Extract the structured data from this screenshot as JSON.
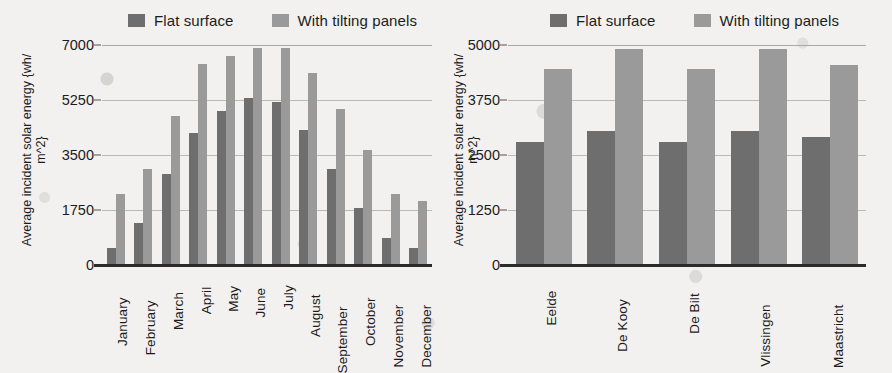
{
  "chart_data": [
    {
      "type": "bar",
      "id": "monthly",
      "title": "",
      "xlabel": "",
      "ylabel": "Average incident solar energy {wh/\nm^2}",
      "ylim": [
        0,
        7000
      ],
      "yticks": [
        0,
        1750,
        3500,
        5250,
        7000
      ],
      "ytick_labels": [
        "0",
        "1750",
        "3500",
        "5250",
        "7000"
      ],
      "grid": true,
      "legend_position": "top",
      "categories": [
        "January",
        "February",
        "March",
        "April",
        "May",
        "June",
        "July",
        "August",
        "September",
        "October",
        "November",
        "December"
      ],
      "series": [
        {
          "name": "Flat surface",
          "color": "#6e6e6e",
          "values": [
            550,
            1350,
            2900,
            4200,
            4900,
            5300,
            5200,
            4300,
            3050,
            1800,
            850,
            550
          ]
        },
        {
          "name": "With tilting panels",
          "color": "#9a9a9a",
          "values": [
            2250,
            3050,
            4750,
            6400,
            6650,
            6900,
            6900,
            6100,
            4950,
            3650,
            2250,
            2050
          ]
        }
      ]
    },
    {
      "type": "bar",
      "id": "stations",
      "title": "",
      "xlabel": "",
      "ylabel": "Average incident solar energy {wh/\nm^2}",
      "ylim": [
        0,
        5000
      ],
      "yticks": [
        0,
        1250,
        2500,
        3750,
        5000
      ],
      "ytick_labels": [
        "0",
        "1250",
        "2500",
        "3750",
        "5000"
      ],
      "grid": true,
      "legend_position": "top",
      "categories": [
        "Eelde",
        "De Kooy",
        "De Bilt",
        "Vlissingen",
        "Maastricht"
      ],
      "series": [
        {
          "name": "Flat surface",
          "color": "#6e6e6e",
          "values": [
            2800,
            3050,
            2800,
            3050,
            2900
          ]
        },
        {
          "name": "With tilting panels",
          "color": "#9a9a9a",
          "values": [
            4450,
            4900,
            4450,
            4900,
            4550
          ]
        }
      ]
    }
  ],
  "colors": {
    "flat_surface": "#6e6e6e",
    "with_tilting_panels": "#9a9a9a",
    "background": "#f2f1ef",
    "gridline": "#b9b9b7",
    "axis": "#2b2b2b"
  }
}
